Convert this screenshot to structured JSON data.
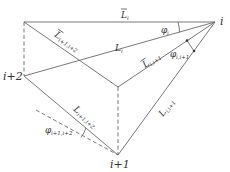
{
  "diagram": {
    "title": "",
    "colors": {
      "line": "#6a6a6a",
      "text": "#333333",
      "background": "#ffffff"
    },
    "nodes": [
      {
        "id": "i",
        "label": "i",
        "x": 215,
        "y": 22
      },
      {
        "id": "i+1",
        "label": "i+1",
        "x": 118,
        "y": 155
      },
      {
        "id": "i+2",
        "label": "i+2",
        "x": 24,
        "y": 76
      },
      {
        "id": "top-left",
        "label": "",
        "x": 24,
        "y": 22
      },
      {
        "id": "interior",
        "label": "",
        "x": 118,
        "y": 87
      }
    ],
    "edges": [
      {
        "from": "top-left",
        "to": "i",
        "label": "L̄",
        "sub": "i",
        "style": "solid"
      },
      {
        "from": "i+2",
        "to": "i",
        "label": "L",
        "sub": "i",
        "style": "solid"
      },
      {
        "from": "top-left",
        "to": "interior",
        "label": "L̄",
        "sub": "i+1,i+2",
        "style": "solid"
      },
      {
        "from": "interior",
        "to": "i",
        "label": "L̄",
        "sub": "i,i+1",
        "style": "solid"
      },
      {
        "from": "i+1",
        "to": "i",
        "label": "L",
        "sub": "i,i+1",
        "style": "solid"
      },
      {
        "from": "i+2",
        "to": "i+1",
        "label": "L",
        "sub": "i+1,i+2",
        "style": "solid"
      },
      {
        "from": "top-left",
        "to": "i+2",
        "label": "",
        "style": "dashed"
      },
      {
        "from": "interior",
        "to": "i+1",
        "label": "",
        "style": "dashed"
      },
      {
        "from": "dashed-start",
        "to": "i+1",
        "label": "",
        "style": "dashed"
      }
    ],
    "angles": [
      {
        "label": "φ",
        "sub": "i",
        "at": "i"
      },
      {
        "label": "φ",
        "sub": "i,i+1",
        "at": "i"
      },
      {
        "label": "φ",
        "sub": "i+1,i+2",
        "at": "i+1"
      }
    ],
    "labels": {
      "node_i": "i",
      "node_i1": "i+1",
      "node_i2": "i+2",
      "Lbar_i_main": "L",
      "Lbar_i_sub": "i",
      "L_i_main": "L",
      "L_i_sub": "i",
      "Lbar_i1i2_main": "L",
      "Lbar_i1i2_sub": "i+1,i+2",
      "Lbar_ii1_main": "L",
      "Lbar_ii1_sub": "i,i+1",
      "L_ii1_main": "L",
      "L_ii1_sub": "i,i+1",
      "L_i1i2_main": "L",
      "L_i1i2_sub": "i+1,i+2",
      "phi_i_main": "φ",
      "phi_i_sub": "i",
      "phi_ii1_main": "φ",
      "phi_ii1_sub": "i,i+1",
      "phi_i1i2_main": "φ",
      "phi_i1i2_sub": "i+1,i+2"
    }
  }
}
